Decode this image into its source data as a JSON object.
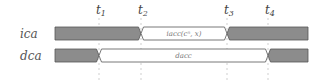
{
  "diagram": {
    "type": "timing-diagram",
    "time_markers": [
      {
        "base": "t",
        "sub": "1"
      },
      {
        "base": "t",
        "sub": "2"
      },
      {
        "base": "t",
        "sub": "3"
      },
      {
        "base": "t",
        "sub": "4"
      }
    ],
    "signals": [
      {
        "name": "ica",
        "segments": [
          {
            "from": "start",
            "to": "t2",
            "state": "inactive",
            "label": ""
          },
          {
            "from": "t2",
            "to": "t3",
            "state": "active",
            "label": "iacc(cⁿ, x)"
          },
          {
            "from": "t3",
            "to": "end",
            "state": "inactive",
            "label": ""
          }
        ]
      },
      {
        "name": "dca",
        "segments": [
          {
            "from": "start",
            "to": "t1",
            "state": "inactive",
            "label": ""
          },
          {
            "from": "t1",
            "to": "t4",
            "state": "active",
            "label": "dacc"
          },
          {
            "from": "t4",
            "to": "end",
            "state": "inactive",
            "label": ""
          }
        ]
      }
    ],
    "colors": {
      "inactive_fill": "#8c8c8c",
      "active_fill": "#ffffff",
      "outline": "#555555",
      "guide": "#cfcfcf"
    }
  }
}
